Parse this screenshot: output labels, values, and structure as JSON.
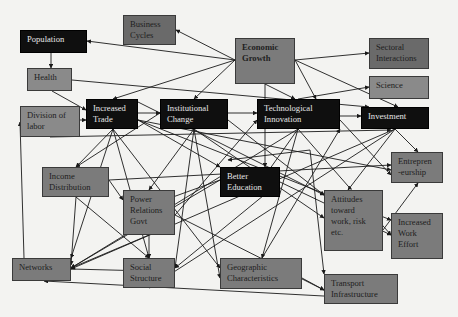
{
  "diagram": {
    "nodes": [
      {
        "id": "population",
        "lines": [
          "Population"
        ],
        "style": "dark",
        "x": 20,
        "y": 30,
        "w": 67,
        "h": 23
      },
      {
        "id": "business-cycles",
        "lines": [
          "Business",
          "Cycles"
        ],
        "style": "deep",
        "x": 123,
        "y": 15,
        "w": 53,
        "h": 30
      },
      {
        "id": "economic-growth",
        "lines": [
          "Economic",
          "Growth"
        ],
        "style": "mid",
        "bold": true,
        "x": 235,
        "y": 38,
        "w": 60,
        "h": 46
      },
      {
        "id": "sectoral-interactions",
        "lines": [
          "Sectoral",
          "Interactions"
        ],
        "style": "deep",
        "x": 369,
        "y": 38,
        "w": 60,
        "h": 31
      },
      {
        "id": "health",
        "lines": [
          "Health"
        ],
        "style": "light",
        "x": 27,
        "y": 68,
        "w": 45,
        "h": 23
      },
      {
        "id": "science",
        "lines": [
          "Science"
        ],
        "style": "light",
        "x": 369,
        "y": 76,
        "w": 60,
        "h": 23
      },
      {
        "id": "division-of-labor",
        "lines": [
          "Division of",
          "labor"
        ],
        "style": "light",
        "x": 20,
        "y": 106,
        "w": 60,
        "h": 31
      },
      {
        "id": "increased-trade",
        "lines": [
          "Increased",
          "Trade"
        ],
        "style": "dark",
        "x": 86,
        "y": 99,
        "w": 52,
        "h": 30
      },
      {
        "id": "institutional-change",
        "lines": [
          "Institutional",
          "Change"
        ],
        "style": "dark",
        "x": 160,
        "y": 99,
        "w": 68,
        "h": 30
      },
      {
        "id": "technological-innovation",
        "lines": [
          "Technological",
          "Innovation"
        ],
        "style": "dark",
        "x": 257,
        "y": 99,
        "w": 83,
        "h": 30
      },
      {
        "id": "investment",
        "lines": [
          "Investment"
        ],
        "style": "dark",
        "x": 361,
        "y": 107,
        "w": 68,
        "h": 22
      },
      {
        "id": "entrepreneurship",
        "lines": [
          "Entrepren",
          "-eurship"
        ],
        "style": "mid",
        "x": 391,
        "y": 152,
        "w": 52,
        "h": 31
      },
      {
        "id": "income-distribution",
        "lines": [
          "Income",
          "Distribution"
        ],
        "style": "mid",
        "x": 42,
        "y": 167,
        "w": 67,
        "h": 30
      },
      {
        "id": "better-education",
        "lines": [
          "Better",
          "Education"
        ],
        "style": "dark",
        "x": 220,
        "y": 167,
        "w": 60,
        "h": 30
      },
      {
        "id": "power-relations-govt",
        "lines": [
          "Power",
          "Relations",
          "Govt"
        ],
        "style": "mid",
        "x": 123,
        "y": 190,
        "w": 52,
        "h": 45
      },
      {
        "id": "attitudes",
        "lines": [
          "Attitudes",
          "toward",
          "work, risk",
          "etc."
        ],
        "style": "mid",
        "x": 324,
        "y": 190,
        "w": 59,
        "h": 61
      },
      {
        "id": "increased-work-effort",
        "lines": [
          "Increased",
          "Work",
          "Effort"
        ],
        "style": "mid",
        "x": 391,
        "y": 213,
        "w": 52,
        "h": 46
      },
      {
        "id": "networks",
        "lines": [
          "Networks"
        ],
        "style": "mid",
        "x": 12,
        "y": 258,
        "w": 59,
        "h": 23
      },
      {
        "id": "social-structure",
        "lines": [
          "Social",
          "Structure"
        ],
        "style": "mid",
        "x": 123,
        "y": 258,
        "w": 52,
        "h": 30
      },
      {
        "id": "geographic-characteristics",
        "lines": [
          "Geographic",
          "Characteristics"
        ],
        "style": "mid",
        "x": 220,
        "y": 258,
        "w": 82,
        "h": 31
      },
      {
        "id": "transport-infrastructure",
        "lines": [
          "Transport",
          "Infrastructure"
        ],
        "style": "mid",
        "x": 324,
        "y": 274,
        "w": 74,
        "h": 30
      }
    ],
    "edges": [
      [
        235,
        60,
        87,
        41
      ],
      [
        235,
        60,
        176,
        30
      ],
      [
        235,
        60,
        113,
        99
      ],
      [
        235,
        60,
        194,
        99
      ],
      [
        295,
        60,
        369,
        53
      ],
      [
        295,
        60,
        398,
        107
      ],
      [
        295,
        60,
        316,
        99
      ],
      [
        265,
        84,
        265,
        167
      ],
      [
        265,
        84,
        295,
        99
      ],
      [
        51,
        53,
        51,
        68
      ],
      [
        72,
        80,
        369,
        107
      ],
      [
        52,
        91,
        86,
        110
      ],
      [
        138,
        113,
        160,
        113
      ],
      [
        228,
        113,
        257,
        113
      ],
      [
        340,
        116,
        361,
        116
      ],
      [
        298,
        99,
        369,
        87
      ],
      [
        80,
        120,
        86,
        120
      ],
      [
        50,
        137,
        391,
        130
      ],
      [
        113,
        129,
        76,
        167
      ],
      [
        113,
        129,
        71,
        258
      ],
      [
        138,
        120,
        220,
        167
      ],
      [
        138,
        120,
        391,
        220
      ],
      [
        138,
        120,
        391,
        170
      ],
      [
        113,
        129,
        149,
        258
      ],
      [
        113,
        129,
        220,
        268
      ],
      [
        194,
        129,
        175,
        268
      ],
      [
        194,
        129,
        220,
        278
      ],
      [
        194,
        129,
        149,
        190
      ],
      [
        194,
        129,
        324,
        218
      ],
      [
        160,
        113,
        76,
        167
      ],
      [
        228,
        120,
        324,
        195
      ],
      [
        298,
        129,
        71,
        268
      ],
      [
        298,
        129,
        391,
        235
      ],
      [
        298,
        129,
        250,
        197
      ],
      [
        298,
        129,
        262,
        258
      ],
      [
        340,
        120,
        391,
        175
      ],
      [
        395,
        129,
        71,
        269
      ],
      [
        395,
        129,
        149,
        288
      ],
      [
        395,
        129,
        348,
        190
      ],
      [
        395,
        129,
        418,
        152
      ],
      [
        138,
        102,
        324,
        195
      ],
      [
        109,
        180,
        123,
        200
      ],
      [
        109,
        180,
        391,
        165
      ],
      [
        76,
        197,
        149,
        258
      ],
      [
        76,
        197,
        71,
        265
      ],
      [
        149,
        235,
        149,
        258
      ],
      [
        175,
        215,
        324,
        290
      ],
      [
        175,
        215,
        257,
        120
      ],
      [
        149,
        235,
        71,
        268
      ],
      [
        280,
        182,
        391,
        235
      ],
      [
        280,
        182,
        175,
        268
      ],
      [
        220,
        180,
        71,
        268
      ],
      [
        220,
        180,
        123,
        215
      ],
      [
        310,
        150,
        324,
        274
      ],
      [
        310,
        150,
        228,
        160
      ],
      [
        302,
        278,
        324,
        290
      ],
      [
        383,
        230,
        418,
        183
      ],
      [
        24,
        258,
        20,
        122
      ],
      [
        71,
        269,
        149,
        271
      ],
      [
        398,
        300,
        44,
        281
      ],
      [
        262,
        258,
        340,
        129
      ]
    ]
  }
}
